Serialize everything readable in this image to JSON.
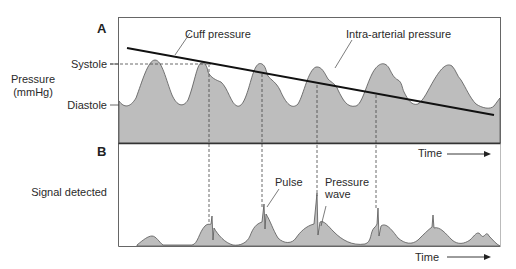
{
  "figure": {
    "panel_a": {
      "letter": "A",
      "y_label_line1": "Pressure",
      "y_label_line2": "(mmHg)",
      "tick_systole": "Systole",
      "tick_diastole": "Diastole",
      "annotation_cuff": "Cuff pressure",
      "annotation_intra": "Intra-arterial pressure",
      "x_label": "Time"
    },
    "panel_b": {
      "letter": "B",
      "y_label": "Signal detected",
      "annotation_pulse": "Pulse",
      "annotation_wave_line1": "Pressure",
      "annotation_wave_line2": "wave",
      "x_label": "Time"
    },
    "colors": {
      "fill": "#bdbdbd",
      "line": "#1a1a1a",
      "frame": "#555555"
    }
  }
}
